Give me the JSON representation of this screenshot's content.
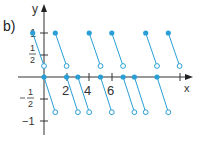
{
  "figure": {
    "label": "b)"
  },
  "chart_data": {
    "type": "scatter",
    "title": "",
    "xlabel": "x",
    "ylabel": "y",
    "x_ticks": [
      "2",
      "4",
      "6"
    ],
    "y_ticks": [
      "1",
      "1/2",
      "-1/2",
      "-1"
    ],
    "xlim": [
      -1,
      12
    ],
    "ylim": [
      -1,
      1.3
    ],
    "grid": false,
    "color": "#2a9fd6",
    "upper_segments": [
      {
        "start": [
          -1,
          1
        ],
        "end": [
          0,
          0.25
        ]
      },
      {
        "start": [
          1,
          1
        ],
        "end": [
          2,
          0.25
        ]
      },
      {
        "start": [
          4,
          1
        ],
        "end": [
          5,
          0.25
        ]
      },
      {
        "start": [
          6,
          1
        ],
        "end": [
          7,
          0.25
        ]
      },
      {
        "start": [
          9,
          1
        ],
        "end": [
          10,
          0.25
        ]
      },
      {
        "start": [
          11,
          1
        ],
        "end": [
          12,
          0.25
        ]
      }
    ],
    "lower_segments": [
      {
        "start": [
          0,
          0
        ],
        "end": [
          1,
          -0.8
        ]
      },
      {
        "start": [
          2,
          0
        ],
        "end": [
          3,
          -0.8
        ]
      },
      {
        "start": [
          3,
          0
        ],
        "end": [
          4,
          -0.8
        ]
      },
      {
        "start": [
          5,
          0
        ],
        "end": [
          6,
          -0.8
        ]
      },
      {
        "start": [
          7,
          0
        ],
        "end": [
          8,
          -0.8
        ]
      },
      {
        "start": [
          8,
          0
        ],
        "end": [
          9,
          -0.8
        ]
      },
      {
        "start": [
          10,
          0
        ],
        "end": [
          11,
          -0.8
        ]
      }
    ]
  }
}
